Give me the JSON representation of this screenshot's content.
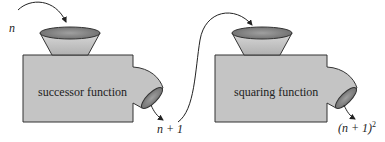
{
  "diagram": {
    "machines": [
      {
        "name": "successor",
        "label": "successor function",
        "input": "n",
        "output": "n + 1"
      },
      {
        "name": "squaring",
        "label": "squaring function",
        "input": "n + 1",
        "output_base": "(n + 1)",
        "output_exp": "2"
      }
    ],
    "colors": {
      "body": "#c4c4c4",
      "outline": "#333333",
      "arrow": "#222222"
    }
  }
}
